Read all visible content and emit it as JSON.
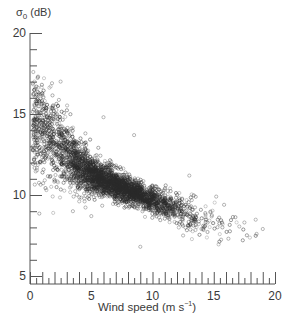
{
  "chart_data": {
    "type": "scatter",
    "title": "",
    "xlabel": "Wind speed (m s⁻¹)",
    "xlabel_unit_power": "−1",
    "ylabel": "σ0 (dB)",
    "xlim": [
      0,
      20
    ],
    "ylim": [
      5,
      20
    ],
    "x_ticks": [
      0,
      5,
      10,
      15,
      20
    ],
    "y_ticks": [
      5,
      10,
      15,
      20
    ],
    "x_minor_step": 0.5,
    "y_minor_step": 1,
    "grid": false,
    "legend": null,
    "marker": "open-circle",
    "marker_color": "#2a2a2a",
    "trend": {
      "x": [
        0.5,
        1,
        2,
        3,
        4,
        5,
        6,
        7,
        8,
        9,
        10,
        11,
        12,
        13,
        14,
        15,
        16,
        17,
        18
      ],
      "y": [
        14.5,
        14.0,
        13.3,
        12.5,
        11.8,
        11.3,
        10.9,
        10.6,
        10.3,
        10.0,
        9.7,
        9.4,
        9.1,
        8.8,
        8.5,
        8.3,
        8.1,
        7.9,
        7.7
      ],
      "spread": [
        1.6,
        1.5,
        1.3,
        1.1,
        0.8,
        0.6,
        0.5,
        0.45,
        0.4,
        0.4,
        0.4,
        0.4,
        0.45,
        0.5,
        0.5,
        0.5,
        0.5,
        0.5,
        0.5
      ],
      "density": [
        120,
        140,
        180,
        220,
        300,
        360,
        380,
        380,
        340,
        280,
        220,
        150,
        90,
        55,
        30,
        18,
        10,
        6,
        4
      ]
    },
    "outliers": [
      {
        "x": 2.5,
        "y": 17.0
      },
      {
        "x": 1.8,
        "y": 16.9
      },
      {
        "x": 6.0,
        "y": 14.8
      },
      {
        "x": 8.5,
        "y": 13.7
      },
      {
        "x": 13.0,
        "y": 11.2
      },
      {
        "x": 15.2,
        "y": 9.9
      },
      {
        "x": 17.5,
        "y": 8.3
      },
      {
        "x": 18.5,
        "y": 7.6
      },
      {
        "x": 19.0,
        "y": 7.9
      },
      {
        "x": 12.5,
        "y": 7.5
      },
      {
        "x": 14.0,
        "y": 7.9
      },
      {
        "x": 3.5,
        "y": 9.0
      },
      {
        "x": 5.0,
        "y": 8.7
      },
      {
        "x": 16.2,
        "y": 7.3
      },
      {
        "x": 9.0,
        "y": 6.8
      }
    ]
  },
  "labels": {
    "ylabel_main": "σ",
    "ylabel_sub": "0",
    "ylabel_unit": " (dB)",
    "xlabel_main": "Wind speed (m s",
    "xlabel_sup": "−1",
    "xlabel_end": ")"
  }
}
